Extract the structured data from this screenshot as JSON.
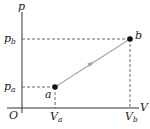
{
  "diagram": {
    "type": "pV-diagram",
    "axes": {
      "y_label": "p",
      "x_label": "V",
      "origin_label": "O"
    },
    "ticks": {
      "y": [
        {
          "base": "p",
          "sub": "b"
        },
        {
          "base": "p",
          "sub": "a"
        }
      ],
      "x": [
        {
          "base": "V",
          "sub": "a"
        },
        {
          "base": "V",
          "sub": "b"
        }
      ]
    },
    "points": [
      {
        "label": "a",
        "x": 55,
        "y": 87
      },
      {
        "label": "b",
        "x": 130,
        "y": 39
      }
    ],
    "process": {
      "from": "a",
      "to": "b",
      "style": "straight line with arrow"
    },
    "colors": {
      "axis": "#333333",
      "dashed": "#555555",
      "process_line": "#a8a8a8",
      "point": "#111111"
    }
  }
}
